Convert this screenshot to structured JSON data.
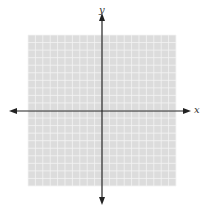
{
  "diagram": {
    "type": "coordinate-plane",
    "x_axis_label": "x",
    "y_axis_label": "y",
    "grid": {
      "columns": 20,
      "rows": 20,
      "background_color": "#dcdcdc",
      "line_color": "#f4f4f4"
    },
    "axis_color": "#222222"
  }
}
